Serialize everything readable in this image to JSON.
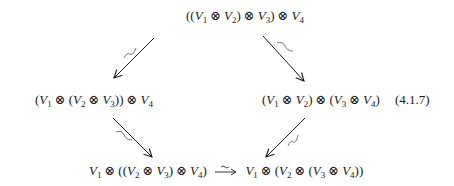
{
  "diagram": {
    "type": "commutative-pentagon-diagram",
    "equation_label": "(4.1.7)",
    "nodes": {
      "top": {
        "text": "((V1 ⊗ V2) ⊗ V3) ⊗ V4"
      },
      "left": {
        "text": "(V1 ⊗ (V2 ⊗ V3)) ⊗ V4"
      },
      "right": {
        "text": "(V1 ⊗ V2) ⊗ (V3 ⊗ V4)"
      },
      "bottom_left": {
        "text": "V1 ⊗ ((V2 ⊗ V3) ⊗ V4)"
      },
      "bottom_right": {
        "text": "V1 ⊗ (V2 ⊗ (V3 ⊗ V4))"
      }
    },
    "edges": [
      {
        "from": "top",
        "to": "left",
        "label": "~",
        "label_meaning": "isomorphism"
      },
      {
        "from": "top",
        "to": "right",
        "label": "~",
        "label_meaning": "isomorphism"
      },
      {
        "from": "left",
        "to": "bottom_left",
        "label": "~",
        "label_meaning": "isomorphism"
      },
      {
        "from": "right",
        "to": "bottom_right",
        "label": "~",
        "label_meaning": "isomorphism"
      },
      {
        "from": "bottom_left",
        "to": "bottom_right",
        "label": "~",
        "label_meaning": "isomorphism"
      }
    ],
    "colors": {
      "ink": "#1a1a1a",
      "background": "#ffffff"
    }
  }
}
